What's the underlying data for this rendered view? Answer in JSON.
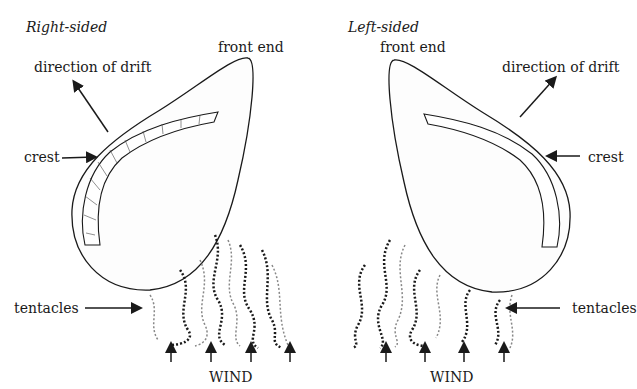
{
  "panels": {
    "right": {
      "title": "Right-sided",
      "front_end": "front end",
      "drift": "direction of drift",
      "crest": "crest",
      "tentacles": "tentacles",
      "wind": "WIND"
    },
    "left": {
      "title": "Left-sided",
      "front_end": "front end",
      "drift": "direction of drift",
      "crest": "crest",
      "tentacles": "tentacles",
      "wind": "WIND"
    }
  },
  "colors": {
    "ink": "#1a1a1a",
    "stipple": "#9a9a9a",
    "background": "#ffffff"
  }
}
